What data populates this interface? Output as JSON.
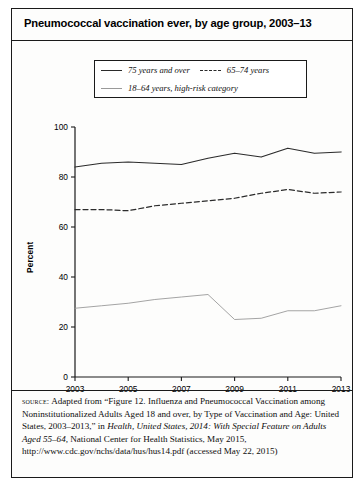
{
  "figure": {
    "title": "Pneumococcal vaccination ever, by age group, 2003–13",
    "ylabel": "Percent",
    "source_label": "source:",
    "source_text_1": " Adapted from “Figure 12. Influenza and Pneumococcal Vaccination among Noninstitutionalized Adults Aged 18 and over, by Type of Vaccination and Age: United States, 2003–2013,” in ",
    "source_italic_1": "Health, United States, 2014: With Special Feature on Adults Aged 55–64,",
    "source_text_2": " National Center for Health Statistics, May 2015, http://www.cdc.gov/nchs/data/hus/hus14.pdf (accessed May 22, 2015)"
  },
  "legend": {
    "items": [
      {
        "label": "75 years and over",
        "style": "solid-thick",
        "color": "#2b2b2b"
      },
      {
        "label": "65–74 years",
        "style": "dashed",
        "color": "#2b2b2b"
      },
      {
        "label": "18–64 years, high-risk category",
        "style": "solid-thin",
        "color": "#9a9a9a"
      }
    ]
  },
  "chart_data": {
    "type": "line",
    "title": "Pneumococcal vaccination ever, by age group, 2003–13",
    "xlabel": "",
    "ylabel": "Percent",
    "x": [
      2003,
      2004,
      2005,
      2006,
      2007,
      2008,
      2009,
      2010,
      2011,
      2012,
      2013
    ],
    "xtick_labels": [
      "2003",
      "2005",
      "2007",
      "2009",
      "2011",
      "2013"
    ],
    "xticks": [
      2003,
      2005,
      2007,
      2009,
      2011,
      2013
    ],
    "yticks": [
      0,
      20,
      40,
      60,
      80,
      100
    ],
    "ytick_labels": [
      "0",
      "20",
      "40",
      "60",
      "80",
      "100"
    ],
    "ylim": [
      0,
      100
    ],
    "xlim": [
      2003,
      2013
    ],
    "grid": false,
    "legend_position": "top-center",
    "series": [
      {
        "name": "75 years and over",
        "style": "solid-thick",
        "color": "#2b2b2b",
        "values": [
          84.0,
          85.5,
          86.0,
          85.5,
          85.0,
          87.5,
          89.5,
          88.0,
          91.5,
          89.5,
          90.0
        ]
      },
      {
        "name": "65–74 years",
        "style": "dashed",
        "color": "#2b2b2b",
        "values": [
          67.0,
          67.0,
          66.5,
          68.5,
          69.5,
          70.5,
          71.5,
          73.5,
          75.0,
          73.5,
          74.0
        ]
      },
      {
        "name": "18–64 years, high-risk category",
        "style": "solid-thin",
        "color": "#9a9a9a",
        "values": [
          27.5,
          28.5,
          29.5,
          31.0,
          32.0,
          33.0,
          23.0,
          23.5,
          26.5,
          26.5,
          28.5
        ]
      }
    ]
  }
}
